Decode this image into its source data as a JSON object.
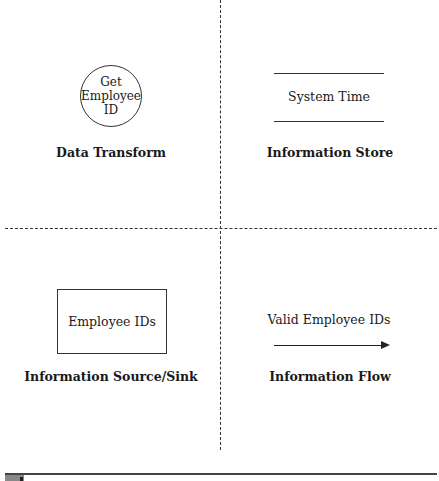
{
  "diagram": {
    "type": "data-flow-diagram-legend",
    "quadrants": [
      {
        "position": "top-left",
        "symbol": "circle",
        "symbol_text_lines": [
          "Get",
          "Employee",
          "ID"
        ],
        "caption": "Data Transform"
      },
      {
        "position": "top-right",
        "symbol": "parallel-lines",
        "symbol_text": "System Time",
        "caption": "Information Store"
      },
      {
        "position": "bottom-left",
        "symbol": "rectangle",
        "symbol_text": "Employee IDs",
        "caption": "Information Source/Sink"
      },
      {
        "position": "bottom-right",
        "symbol": "arrow",
        "symbol_text": "Valid Employee IDs",
        "caption": "Information Flow"
      }
    ],
    "dividers": {
      "vertical": "dashed",
      "horizontal": "dashed"
    },
    "colors": {
      "line": "#333333",
      "text": "#1a1a1a",
      "background": "#ffffff"
    }
  }
}
